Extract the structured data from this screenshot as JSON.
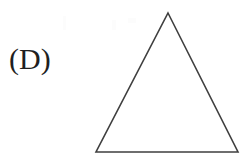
{
  "figure": {
    "label": "(D)",
    "background_color": "#ffffff",
    "label_color": "#1f1f1f",
    "stroke_color": "#3f3f3f",
    "stroke_width": 1.6,
    "canvas": {
      "width": 251,
      "height": 160
    },
    "shape": {
      "name": "triangle",
      "kind": "isosceles-triangle",
      "fill": "none",
      "vertices": [
        {
          "name": "apex",
          "x": 168,
          "y": 13
        },
        {
          "name": "bottom-right",
          "x": 238,
          "y": 152
        },
        {
          "name": "bottom-left",
          "x": 96,
          "y": 152
        }
      ],
      "points": "168,13 238,152 96,152",
      "base_width": 142,
      "height": 139
    },
    "artifacts": [
      {
        "name": "speck-1",
        "x": 63,
        "y": 16,
        "width": 3,
        "height": 14
      },
      {
        "name": "speck-2",
        "x": 112,
        "y": 20,
        "width": 4,
        "height": 10
      },
      {
        "name": "speck-3",
        "x": 128,
        "y": 18,
        "width": 8,
        "height": 5
      }
    ]
  }
}
